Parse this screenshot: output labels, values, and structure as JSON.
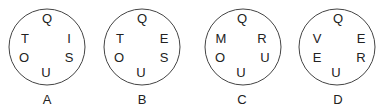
{
  "circles": [
    {
      "label": "A",
      "cx": 47,
      "letters": {
        "top": "Q",
        "upper_left": "T",
        "upper_right": "I",
        "lower_left": "O",
        "lower_right": "S",
        "bottom": "U"
      }
    },
    {
      "label": "B",
      "cx": 142,
      "letters": {
        "top": "Q",
        "upper_left": "T",
        "upper_right": "E",
        "lower_left": "O",
        "lower_right": "S",
        "bottom": "U"
      }
    },
    {
      "label": "C",
      "cx": 241,
      "letters": {
        "top": "Q",
        "upper_left": "M",
        "upper_right": "R",
        "lower_left": "O",
        "lower_right": "U",
        "bottom": "U"
      }
    },
    {
      "label": "D",
      "cx": 337,
      "letters": {
        "top": "Q",
        "upper_left": "V",
        "upper_right": "E",
        "lower_left": "E",
        "lower_right": "R",
        "bottom": "U"
      }
    }
  ],
  "colors": {
    "stroke": "#444444",
    "text": "#222222"
  }
}
